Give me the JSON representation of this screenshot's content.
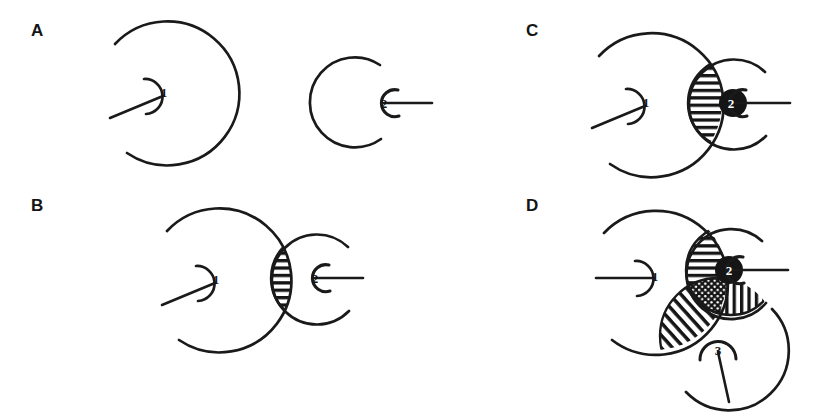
{
  "figure": {
    "background": "#ffffff",
    "ink": "#1a1a1a",
    "width": 823,
    "height": 413
  },
  "panels": [
    {
      "id": "A",
      "label": "A",
      "description": "Two separate non-touching circles, each containing a small broken-ring marker with a leader line.",
      "markers": [
        "1",
        "2"
      ],
      "overlaps": []
    },
    {
      "id": "B",
      "label": "B",
      "description": "The two circles intersect slightly; the narrow lens-shaped intersection is filled with horizontal hatching.",
      "markers": [
        "1",
        "2"
      ],
      "overlaps": [
        {
          "regions": "1-2",
          "fill": "horizontal-hatch"
        }
      ]
    },
    {
      "id": "C",
      "label": "C",
      "description": "The two circles overlap deeply; the large lens intersection is filled with horizontal hatching and marker 2 sits inside it as a solid dark disc.",
      "markers": [
        "1",
        "2"
      ],
      "overlaps": [
        {
          "regions": "1-2",
          "fill": "horizontal-hatch"
        }
      ]
    },
    {
      "id": "D",
      "label": "D",
      "description": "Three circles mutually overlap. Pairwise lenses carry horizontal, vertical and diagonal hatching; the central triple-overlap is stippled.",
      "markers": [
        "1",
        "2",
        "3"
      ],
      "overlaps": [
        {
          "regions": "1-2",
          "fill": "horizontal-hatch"
        },
        {
          "regions": "2-3",
          "fill": "vertical-hatch"
        },
        {
          "regions": "1-3",
          "fill": "diagonal-hatch"
        },
        {
          "regions": "1-2-3",
          "fill": "stipple"
        }
      ]
    }
  ],
  "markers": {
    "one": "1",
    "two": "2",
    "three": "3"
  },
  "legend_patterns": {
    "horizontal_hatch": "horizontal-hatch",
    "vertical_hatch": "vertical-hatch",
    "diagonal_hatch": "diagonal-hatch",
    "stipple": "stipple",
    "solid": "solid-black"
  }
}
